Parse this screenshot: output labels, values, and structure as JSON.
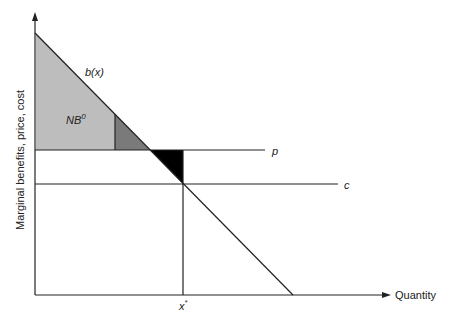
{
  "diagram": {
    "type": "economics-supply-demand",
    "y_axis_label": "Marginal benefits, price, cost",
    "x_axis_label": "Quantity",
    "curves": {
      "benefit": {
        "label": "b(x)"
      },
      "price": {
        "label": "p"
      },
      "cost": {
        "label": "c"
      }
    },
    "areas": {
      "net_benefit": {
        "label_main": "NB",
        "label_sup": "0",
        "color": "#bdbdbd"
      },
      "dark_triangle": {
        "color": "#7a7a7a"
      },
      "black_triangle": {
        "color": "#000000"
      }
    },
    "x_marker": {
      "label_main": "x",
      "label_sup": "*"
    }
  }
}
